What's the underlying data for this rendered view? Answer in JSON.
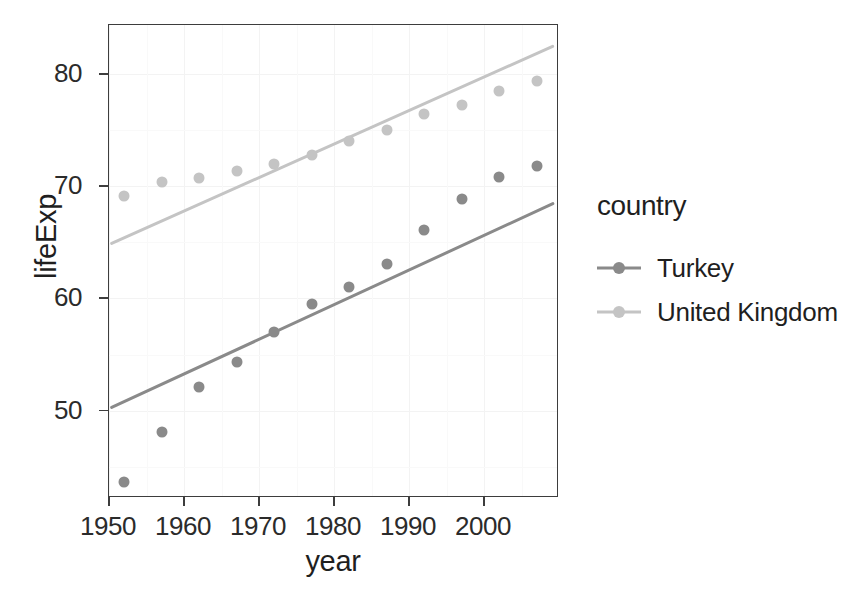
{
  "chart_data": {
    "type": "scatter",
    "title": "",
    "xlabel": "year",
    "ylabel": "lifeExp",
    "xlim": [
      1950.0,
      2010.0
    ],
    "ylim": [
      42.2,
      84.4
    ],
    "xticks": [
      1950,
      1960,
      1970,
      1980,
      1990,
      2000
    ],
    "yticks": [
      50,
      60,
      70,
      80
    ],
    "grid": true,
    "legend_position": "right",
    "legend_title": "country",
    "x": [
      1952,
      1957,
      1962,
      1967,
      1972,
      1977,
      1982,
      1987,
      1992,
      1997,
      2002,
      2007
    ],
    "series": [
      {
        "name": "Turkey",
        "color": "#8a8a8a",
        "values": [
          43.585,
          48.079,
          52.098,
          54.336,
          57.005,
          59.507,
          61.036,
          63.108,
          66.146,
          68.835,
          70.845,
          71.777
        ],
        "fit": {
          "x": [
            1950.3,
            2009.5
          ],
          "y": [
            50.2,
            68.5
          ]
        }
      },
      {
        "name": "United Kingdom",
        "color": "#c4c4c4",
        "values": [
          69.18,
          70.42,
          70.76,
          71.36,
          72.01,
          72.76,
          74.04,
          75.007,
          76.42,
          77.218,
          78.471,
          79.425
        ],
        "fit": {
          "x": [
            1950.3,
            2009.5
          ],
          "y": [
            64.9,
            82.6
          ]
        }
      }
    ]
  },
  "legend": {
    "title": "country",
    "items": [
      {
        "label": "Turkey",
        "color": "#8a8a8a"
      },
      {
        "label": "United Kingdom",
        "color": "#c4c4c4"
      }
    ]
  },
  "axes": {
    "x_title": "year",
    "y_title": "lifeExp",
    "x_tick_labels": [
      "1950",
      "1960",
      "1970",
      "1980",
      "1990",
      "2000"
    ],
    "y_tick_labels": [
      "50",
      "60",
      "70",
      "80"
    ]
  }
}
